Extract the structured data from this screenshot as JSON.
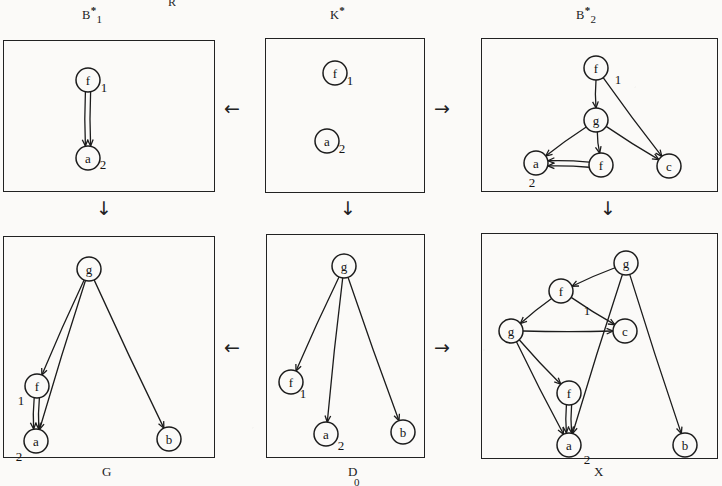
{
  "page": {
    "cut_header_text": "R",
    "canvas": {
      "width": 722,
      "height": 486
    }
  },
  "diagram": {
    "title_labels": {
      "top_left": {
        "base": "B",
        "star": "*",
        "sub": "1"
      },
      "top_mid": {
        "base": "K",
        "star": "*",
        "sub": ""
      },
      "top_right": {
        "base": "B",
        "star": "*",
        "sub": "2"
      }
    },
    "bottom_labels": {
      "left": "G",
      "mid": "D",
      "mid_sub": "0",
      "right": "X"
    },
    "connector_arrows": [
      {
        "name": "arrow-top-left",
        "glyph": "←"
      },
      {
        "name": "arrow-top-right",
        "glyph": "→"
      },
      {
        "name": "arrow-bottom-left",
        "glyph": "←"
      },
      {
        "name": "arrow-bottom-right",
        "glyph": "→"
      },
      {
        "name": "arrow-down-left",
        "glyph": "↓"
      },
      {
        "name": "arrow-down-mid",
        "glyph": "↓"
      },
      {
        "name": "arrow-down-right",
        "glyph": "↓"
      }
    ]
  },
  "graphs": {
    "b1": {
      "name": "B1-star-graph",
      "nodes": [
        {
          "id": "f",
          "label": "f",
          "x": 85,
          "y": 40,
          "num": "1",
          "num_dx": 16,
          "num_dy": 12
        },
        {
          "id": "a",
          "label": "a",
          "x": 85,
          "y": 118,
          "num": "2",
          "num_dx": 15,
          "num_dy": 11
        }
      ],
      "edges": [
        {
          "from": "f",
          "to": "a",
          "kind": "double-down"
        }
      ]
    },
    "k": {
      "name": "K-star-graph",
      "nodes": [
        {
          "id": "f",
          "label": "f",
          "x": 70,
          "y": 35,
          "num": "1",
          "num_dx": 15,
          "num_dy": 12
        },
        {
          "id": "a",
          "label": "a",
          "x": 62,
          "y": 103,
          "num": "2",
          "num_dx": 15,
          "num_dy": 12
        }
      ],
      "edges": []
    },
    "b2": {
      "name": "B2-star-graph",
      "nodes": [
        {
          "id": "f1",
          "label": "f",
          "x": 115,
          "y": 30,
          "num": "1",
          "num_dx": 22,
          "num_dy": 16
        },
        {
          "id": "g",
          "label": "g",
          "x": 115,
          "y": 82,
          "num": "",
          "num_dx": 0,
          "num_dy": 0
        },
        {
          "id": "a",
          "label": "a",
          "x": 55,
          "y": 125,
          "num": "2",
          "num_dx": -4,
          "num_dy": 24
        },
        {
          "id": "f2",
          "label": "f",
          "x": 120,
          "y": 127,
          "num": "",
          "num_dx": 0,
          "num_dy": 0
        },
        {
          "id": "c",
          "label": "c",
          "x": 188,
          "y": 128,
          "num": "",
          "num_dx": 0,
          "num_dy": 0
        }
      ],
      "edges": [
        {
          "from": "f1",
          "to": "g",
          "kind": "line"
        },
        {
          "from": "f1",
          "to": "c",
          "kind": "line"
        },
        {
          "from": "g",
          "to": "a",
          "kind": "line"
        },
        {
          "from": "g",
          "to": "f2",
          "kind": "line"
        },
        {
          "from": "g",
          "to": "c",
          "kind": "line"
        },
        {
          "from": "f2",
          "to": "a",
          "kind": "double-h"
        }
      ]
    },
    "g": {
      "name": "G-graph",
      "nodes": [
        {
          "id": "g",
          "label": "g",
          "x": 86,
          "y": 33,
          "num": "",
          "num_dx": 0,
          "num_dy": 0
        },
        {
          "id": "f",
          "label": "f",
          "x": 34,
          "y": 150,
          "num": "1",
          "num_dx": -16,
          "num_dy": 19
        },
        {
          "id": "a",
          "label": "a",
          "x": 33,
          "y": 205,
          "num": "2",
          "num_dx": -17,
          "num_dy": 20
        },
        {
          "id": "b",
          "label": "b",
          "x": 166,
          "y": 203,
          "num": "",
          "num_dx": 0,
          "num_dy": 0
        }
      ],
      "edges": [
        {
          "from": "g",
          "to": "f",
          "kind": "line"
        },
        {
          "from": "g",
          "to": "a",
          "kind": "line"
        },
        {
          "from": "g",
          "to": "b",
          "kind": "line"
        },
        {
          "from": "f",
          "to": "a",
          "kind": "double-down"
        }
      ]
    },
    "d": {
      "name": "D-graph",
      "nodes": [
        {
          "id": "g",
          "label": "g",
          "x": 78,
          "y": 32,
          "num": "",
          "num_dx": 0,
          "num_dy": 0
        },
        {
          "id": "f",
          "label": "f",
          "x": 25,
          "y": 148,
          "num": "1",
          "num_dx": 12,
          "num_dy": 16
        },
        {
          "id": "a",
          "label": "a",
          "x": 60,
          "y": 200,
          "num": "2",
          "num_dx": 15,
          "num_dy": 16
        },
        {
          "id": "b",
          "label": "b",
          "x": 137,
          "y": 198,
          "num": "",
          "num_dx": 0,
          "num_dy": 0
        }
      ],
      "edges": [
        {
          "from": "g",
          "to": "f",
          "kind": "line"
        },
        {
          "from": "g",
          "to": "a",
          "kind": "line"
        },
        {
          "from": "g",
          "to": "b",
          "kind": "line"
        }
      ]
    },
    "x": {
      "name": "X-graph",
      "nodes": [
        {
          "id": "g1",
          "label": "g",
          "x": 145,
          "y": 30,
          "num": "",
          "num_dx": 0,
          "num_dy": 0
        },
        {
          "id": "f1",
          "label": "f",
          "x": 80,
          "y": 58,
          "num": "",
          "num_dx": 0,
          "num_dy": 0
        },
        {
          "id": "g2",
          "label": "g",
          "x": 30,
          "y": 98,
          "num": "",
          "num_dx": 0,
          "num_dy": 0
        },
        {
          "id": "c",
          "label": "c",
          "x": 144,
          "y": 98,
          "num": "1",
          "num_dx": -38,
          "num_dy": -16
        },
        {
          "id": "f2",
          "label": "f",
          "x": 88,
          "y": 160,
          "num": "",
          "num_dx": 0,
          "num_dy": 0
        },
        {
          "id": "a",
          "label": "a",
          "x": 88,
          "y": 212,
          "num": "2",
          "num_dx": 18,
          "num_dy": 19
        },
        {
          "id": "b",
          "label": "b",
          "x": 204,
          "y": 212,
          "num": "",
          "num_dx": 0,
          "num_dy": 0
        }
      ],
      "edges": [
        {
          "from": "g1",
          "to": "f1",
          "kind": "line"
        },
        {
          "from": "g1",
          "to": "a",
          "kind": "line"
        },
        {
          "from": "g1",
          "to": "b",
          "kind": "line"
        },
        {
          "from": "f1",
          "to": "g2",
          "kind": "line"
        },
        {
          "from": "f1",
          "to": "c",
          "kind": "line"
        },
        {
          "from": "g2",
          "to": "c",
          "kind": "line"
        },
        {
          "from": "g2",
          "to": "f2",
          "kind": "line"
        },
        {
          "from": "g2",
          "to": "a",
          "kind": "line"
        },
        {
          "from": "f2",
          "to": "a",
          "kind": "double-down"
        }
      ]
    }
  },
  "boxes": [
    {
      "name": "box-b1",
      "x": 3,
      "y": 40,
      "w": 212,
      "h": 152
    },
    {
      "name": "box-k",
      "x": 265,
      "y": 38,
      "w": 160,
      "h": 155
    },
    {
      "name": "box-b2",
      "x": 481,
      "y": 38,
      "w": 237,
      "h": 154
    },
    {
      "name": "box-g",
      "x": 3,
      "y": 236,
      "w": 212,
      "h": 222
    },
    {
      "name": "box-d",
      "x": 266,
      "y": 234,
      "w": 159,
      "h": 224
    },
    {
      "name": "box-x",
      "x": 481,
      "y": 233,
      "w": 237,
      "h": 226
    }
  ]
}
